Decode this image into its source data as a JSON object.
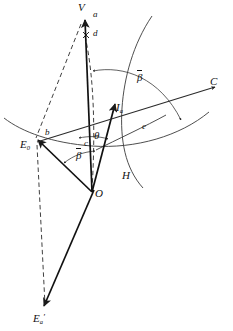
{
  "figure": {
    "width": 233,
    "height": 331,
    "background": "#ffffff",
    "stroke": "#1a1a1a"
  },
  "labels": {
    "V": "V",
    "a": "a",
    "d": "d",
    "C": "C",
    "beta_upper": "β",
    "beta_lower": "β",
    "theta": "θ",
    "c": "c",
    "e": "e",
    "b": "b",
    "H": "H",
    "O": "O",
    "I_a": "I",
    "I_a_sub": "a",
    "E_0": "E",
    "E_0_sub": "0",
    "E_a_prime": "E",
    "E_a_prime_sub": "a",
    "E_a_prime_mark": "′"
  },
  "points": {
    "V": {
      "x": 82,
      "y": 14,
      "name": "vertex-v"
    },
    "O": {
      "x": 92,
      "y": 192,
      "name": "origin-o"
    },
    "E0": {
      "x": 36,
      "y": 140,
      "name": "point-e0"
    },
    "Ia": {
      "x": 118,
      "y": 110,
      "name": "point-ia"
    },
    "C": {
      "x": 212,
      "y": 88,
      "name": "point-c"
    },
    "Ea": {
      "x": 45,
      "y": 311,
      "name": "point-ea-prime"
    },
    "H": {
      "x": 129,
      "y": 174,
      "name": "point-h"
    },
    "d": {
      "x": 88,
      "y": 35,
      "name": "point-d"
    }
  },
  "elements": {
    "vector_ov": "line-o-to-v",
    "vector_o_ia": "line-o-to-ia",
    "vector_o_e0": "line-o-to-e0",
    "vector_o_ea_prime": "line-o-to-ea-prime",
    "ray_c": "line-e0-to-c",
    "dashed_v_e0": "dashed-line-v-e0",
    "dashed_v_o": "dashed-line-v-o",
    "dashed_vertical_e0_ea": "dashed-vertical-e0-ea",
    "arc_great_circle_top": "arc-great-circle-upper",
    "arc_horizon": "arc-horizon-through-e0",
    "arc_e": "arc-e",
    "arc_beta_upper": "arc-angle-beta-upper",
    "arc_beta_lower": "arc-angle-beta-lower",
    "arc_theta": "arc-angle-theta"
  }
}
